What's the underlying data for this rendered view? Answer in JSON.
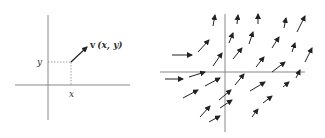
{
  "left_panel": {
    "axes": {
      "x_axis": {
        "x1": 15,
        "x2": 130,
        "y": 85
      },
      "y_axis": {
        "x": 48,
        "y1": 15,
        "y2": 120
      }
    },
    "point": {
      "x": 71,
      "y": 62
    },
    "vector": {
      "x1": 71,
      "y1": 62,
      "x2": 87,
      "y2": 47
    },
    "labels": {
      "vector_bold": "v",
      "vector_args": "(x, y)",
      "y_label": "y",
      "x_label": "x"
    }
  },
  "right_panel": {
    "axes": {
      "x_axis": {
        "x1": 160,
        "x2": 305,
        "y": 72
      },
      "y_axis": {
        "x": 225,
        "y1": 14,
        "y2": 132
      }
    },
    "arrows": [
      [
        213,
        26,
        215,
        15
      ],
      [
        237,
        24,
        238,
        15
      ],
      [
        258,
        24,
        258,
        14
      ],
      [
        284,
        28,
        286,
        18
      ],
      [
        297,
        32,
        305,
        16
      ],
      [
        172,
        55,
        192,
        55
      ],
      [
        198,
        52,
        209,
        40
      ],
      [
        229,
        43,
        233,
        33
      ],
      [
        249,
        44,
        253,
        32
      ],
      [
        272,
        48,
        279,
        37
      ],
      [
        292,
        52,
        295,
        43
      ],
      [
        305,
        62,
        312,
        48
      ],
      [
        213,
        66,
        222,
        53
      ],
      [
        233,
        59,
        242,
        48
      ],
      [
        256,
        67,
        264,
        57
      ],
      [
        272,
        72,
        285,
        62
      ],
      [
        165,
        79,
        183,
        79
      ],
      [
        189,
        77,
        205,
        72
      ],
      [
        296,
        78,
        300,
        70
      ],
      [
        205,
        86,
        220,
        78
      ],
      [
        235,
        85,
        244,
        74
      ],
      [
        183,
        98,
        198,
        90
      ],
      [
        219,
        100,
        231,
        90
      ],
      [
        250,
        91,
        265,
        82
      ],
      [
        283,
        87,
        289,
        82
      ],
      [
        220,
        108,
        232,
        100
      ],
      [
        263,
        103,
        272,
        96
      ],
      [
        200,
        117,
        210,
        106
      ],
      [
        209,
        122,
        220,
        116
      ],
      [
        252,
        117,
        258,
        109
      ]
    ]
  },
  "colors": {
    "axis": "#888888",
    "arrow": "#222222",
    "dotted": "#888888"
  }
}
